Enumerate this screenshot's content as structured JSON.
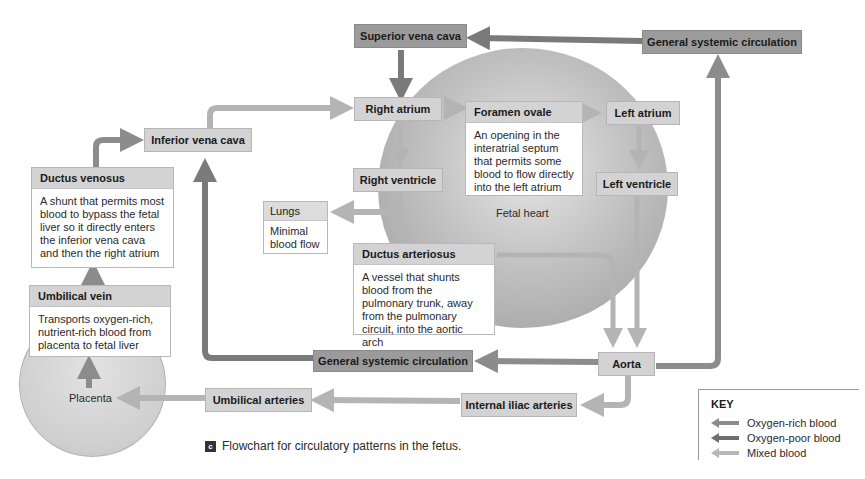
{
  "colors": {
    "oxygen_rich": "#8c8c8c",
    "oxygen_poor": "#7a7a7a",
    "mixed": "#b4b4b4",
    "box_mixed": "#d3d3d3",
    "box_poor": "#9b9b9b"
  },
  "nodes": {
    "superior_vena_cava": "Superior vena cava",
    "general_systemic_top": "General systemic circulation",
    "right_atrium": "Right atrium",
    "foramen_ovale": {
      "title": "Foramen ovale",
      "description": "An opening in the interatrial septum that permits some blood to flow directly into the left atrium"
    },
    "left_atrium": "Left atrium",
    "right_ventricle": "Right ventricle",
    "left_ventricle": "Left ventricle",
    "fetal_heart": "Fetal heart",
    "inferior_vena_cava": "Inferior vena cava",
    "ductus_venosus": {
      "title": "Ductus venosus",
      "description": "A shunt that permits most blood to bypass the fetal liver so it directly enters the inferior vena cava and then the right atrium"
    },
    "umbilical_vein": {
      "title": "Umbilical vein",
      "description": "Transports oxygen-rich, nutrient-rich blood from placenta to fetal liver"
    },
    "lungs": {
      "title": "Lungs",
      "description": "Minimal blood flow"
    },
    "ductus_arteriosus": {
      "title": "Ductus arteriosus",
      "description": "A vessel that shunts blood from the pulmonary trunk, away from the pulmonary circuit, into the aortic arch"
    },
    "general_systemic_bottom": "General systemic circulation",
    "aorta": "Aorta",
    "placenta": "Placenta",
    "umbilical_arteries": "Umbilical arteries",
    "internal_iliac_arteries": "Internal iliac arteries"
  },
  "caption": {
    "badge": "c",
    "text": "Flowchart for circulatory patterns in the fetus."
  },
  "key": {
    "title": "KEY",
    "items": [
      {
        "label": "Oxygen-rich blood",
        "color": "#8c8c8c"
      },
      {
        "label": "Oxygen-poor blood",
        "color": "#6e6e6e"
      },
      {
        "label": "Mixed blood",
        "color": "#b8b8b8"
      }
    ]
  }
}
